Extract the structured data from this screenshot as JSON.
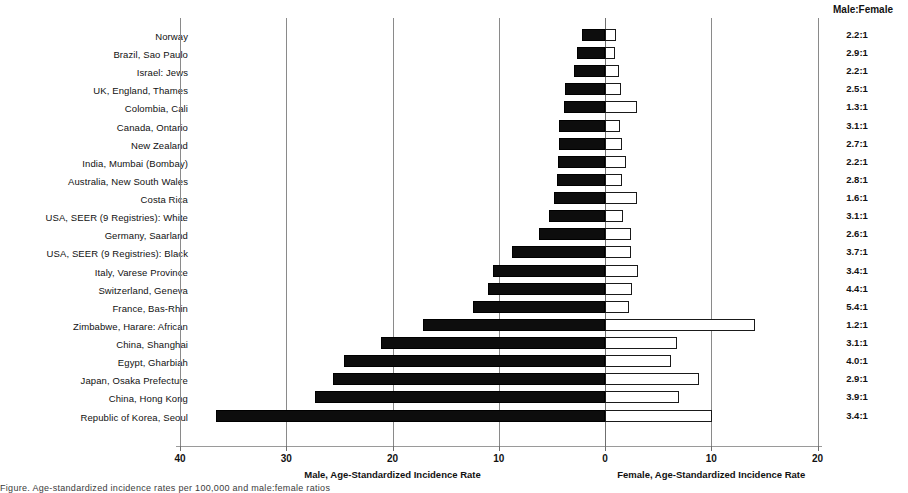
{
  "chart_data": {
    "type": "bar",
    "orientation": "horizontal",
    "subtype": "diverging-population-pyramid",
    "title": "",
    "categories": [
      "Norway",
      "Brazil, Sao Paulo",
      "Israel: Jews",
      "UK, England, Thames",
      "Colombia, Cali",
      "Canada, Ontario",
      "New Zealand",
      "India, Mumbai (Bombay)",
      "Australia, New South Wales",
      "Costa Rica",
      "USA, SEER (9 Registries): White",
      "Germany, Saarland",
      "USA, SEER (9 Registries): Black",
      "Italy, Varese Province",
      "Switzerland, Geneva",
      "France, Bas-Rhin",
      "Zimbabwe, Harare: African",
      "China, Shanghai",
      "Egypt, Gharbiah",
      "Japan, Osaka Prefecture",
      "China, Hong Kong",
      "Republic of Korea, Seoul"
    ],
    "series": [
      {
        "name": "Male, Age-Standardized Incidence Rate",
        "color": "#0d0d0d",
        "direction": "left",
        "values": [
          2.2,
          2.6,
          2.9,
          3.8,
          3.9,
          4.3,
          4.3,
          4.4,
          4.5,
          4.8,
          5.3,
          6.2,
          8.8,
          10.5,
          11.0,
          12.4,
          17.1,
          21.1,
          24.6,
          25.6,
          27.3,
          36.6
        ]
      },
      {
        "name": "Female, Age-Standardized Incidence Rate",
        "color": "#ffffff",
        "direction": "right",
        "values": [
          1.0,
          0.9,
          1.3,
          1.5,
          3.0,
          1.4,
          1.6,
          2.0,
          1.6,
          3.0,
          1.7,
          2.4,
          2.4,
          3.1,
          2.5,
          2.3,
          14.1,
          6.8,
          6.2,
          8.8,
          7.0,
          10.1
        ]
      }
    ],
    "ratio_header": "Male:Female",
    "ratios": [
      "2.2:1",
      "2.9:1",
      "2.2:1",
      "2.5:1",
      "1.3:1",
      "3.1:1",
      "2.7:1",
      "2.2:1",
      "2.8:1",
      "1.6:1",
      "3.1:1",
      "2.6:1",
      "3.7:1",
      "3.4:1",
      "4.4:1",
      "5.4:1",
      "1.2:1",
      "3.1:1",
      "4.0:1",
      "2.9:1",
      "3.9:1",
      "3.4:1"
    ],
    "xlabel_left": "Male, Age-Standardized Incidence Rate",
    "xlabel_right": "Female, Age-Standardized Incidence Rate",
    "x_ticks": [
      {
        "label": "40",
        "male_value": 40
      },
      {
        "label": "30",
        "male_value": 30
      },
      {
        "label": "20",
        "male_value": 20
      },
      {
        "label": "10",
        "male_value": 10
      },
      {
        "label": "0",
        "male_value": 0
      },
      {
        "label": "10",
        "female_value": 10
      },
      {
        "label": "20",
        "female_value": 20
      }
    ],
    "xlim_male": [
      0,
      40
    ],
    "xlim_female": [
      0,
      20
    ],
    "grid": true,
    "legend": "none"
  },
  "caption": {
    "text": "Figure. Age-standardized incidence rates per 100,000 and male:female ratios"
  }
}
